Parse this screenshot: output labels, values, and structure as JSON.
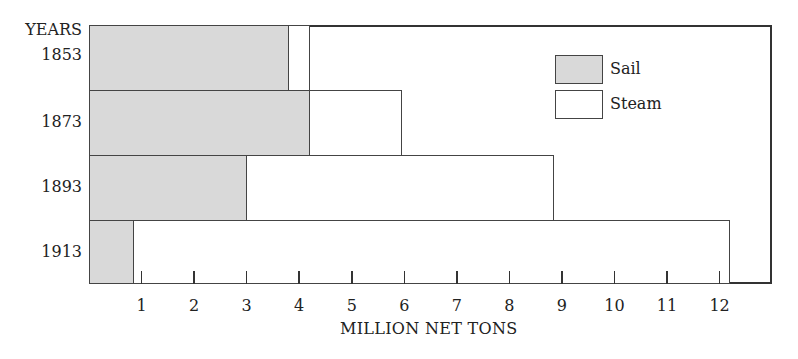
{
  "chart_data": {
    "type": "bar",
    "orientation": "horizontal",
    "title": "",
    "xlabel": "MILLION NET TONS",
    "ylabel": "YEARS",
    "categories": [
      "1853",
      "1873",
      "1893",
      "1913"
    ],
    "series": [
      {
        "name": "Sail",
        "values": [
          3.8,
          4.2,
          3.0,
          0.85
        ],
        "color": "#d9d9d9"
      },
      {
        "name": "Steam",
        "values": [
          4.2,
          5.95,
          8.85,
          12.2
        ],
        "color": "#ffffff"
      }
    ],
    "xticks": [
      "1",
      "2",
      "3",
      "4",
      "5",
      "6",
      "7",
      "8",
      "9",
      "10",
      "11",
      "12"
    ],
    "xlim": [
      0,
      13
    ],
    "grid": false,
    "legend_position": "upper right, inside",
    "note": "Bars overlaid from zero; sail bar drawn over steam bar"
  },
  "legend": {
    "sail": "Sail",
    "steam": "Steam"
  },
  "axis": {
    "y_title": "YEARS",
    "x_title": "MILLION NET TONS"
  }
}
